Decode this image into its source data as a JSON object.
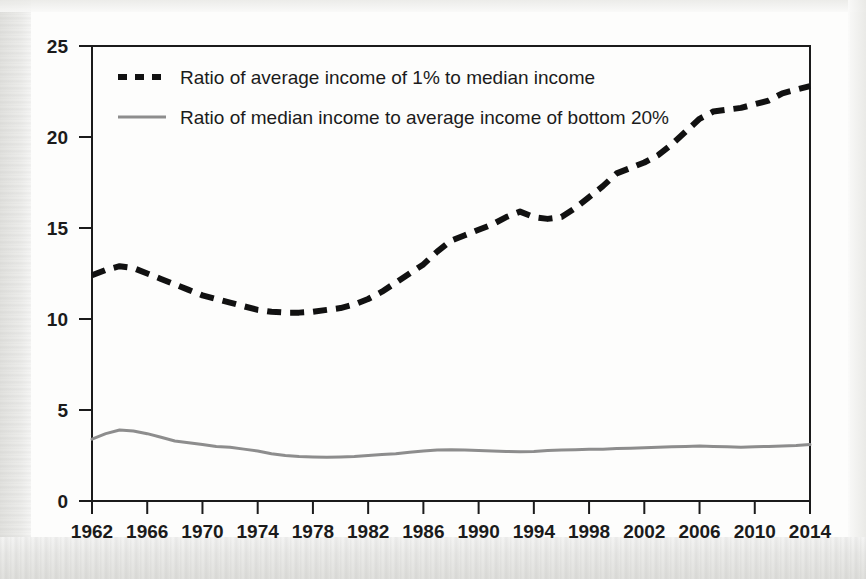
{
  "chart_data": {
    "type": "line",
    "title": "",
    "xlabel": "",
    "ylabel": "",
    "xlim": [
      1962,
      2014
    ],
    "ylim": [
      0,
      25
    ],
    "grid": false,
    "legend_position": "top-left",
    "xticks": [
      1962,
      1966,
      1970,
      1974,
      1978,
      1982,
      1986,
      1990,
      1994,
      1998,
      2002,
      2006,
      2010,
      2014
    ],
    "yticks": [
      0,
      5,
      10,
      15,
      20,
      25
    ],
    "x": [
      1962,
      1963,
      1964,
      1965,
      1966,
      1967,
      1968,
      1969,
      1970,
      1971,
      1972,
      1973,
      1974,
      1975,
      1976,
      1977,
      1978,
      1979,
      1980,
      1981,
      1982,
      1983,
      1984,
      1985,
      1986,
      1987,
      1988,
      1989,
      1990,
      1991,
      1992,
      1993,
      1994,
      1995,
      1996,
      1997,
      1998,
      1999,
      2000,
      2001,
      2002,
      2003,
      2004,
      2005,
      2006,
      2007,
      2008,
      2009,
      2010,
      2011,
      2012,
      2013,
      2014
    ],
    "series": [
      {
        "name": "Ratio of average income of 1% to median income",
        "style": "dashed",
        "color": "#111111",
        "values": [
          12.4,
          12.7,
          12.9,
          12.8,
          12.5,
          12.2,
          11.9,
          11.6,
          11.3,
          11.1,
          10.9,
          10.7,
          10.5,
          10.4,
          10.35,
          10.35,
          10.4,
          10.5,
          10.6,
          10.8,
          11.1,
          11.5,
          12.0,
          12.5,
          13.0,
          13.7,
          14.3,
          14.6,
          14.9,
          15.2,
          15.6,
          15.9,
          15.6,
          15.5,
          15.6,
          16.1,
          16.7,
          17.3,
          18.0,
          18.3,
          18.6,
          19.0,
          19.6,
          20.3,
          21.0,
          21.4,
          21.5,
          21.6,
          21.8,
          22.0,
          22.4,
          22.6,
          22.8
        ]
      },
      {
        "name": "Ratio of median income to average income of bottom 20%",
        "style": "solid",
        "color": "#8d8d8d",
        "values": [
          3.4,
          3.7,
          3.9,
          3.85,
          3.7,
          3.5,
          3.3,
          3.2,
          3.1,
          3.0,
          2.95,
          2.85,
          2.75,
          2.6,
          2.5,
          2.45,
          2.42,
          2.4,
          2.42,
          2.45,
          2.5,
          2.55,
          2.6,
          2.68,
          2.75,
          2.8,
          2.82,
          2.8,
          2.78,
          2.75,
          2.72,
          2.7,
          2.72,
          2.78,
          2.8,
          2.82,
          2.85,
          2.85,
          2.88,
          2.9,
          2.92,
          2.95,
          2.98,
          3.0,
          3.02,
          3.0,
          2.98,
          2.96,
          2.98,
          3.0,
          3.02,
          3.05,
          3.1
        ]
      }
    ]
  },
  "axis": {
    "y_tick_labels": [
      "25",
      "20",
      "15",
      "10",
      "5",
      "0"
    ],
    "x_tick_labels": [
      "1962",
      "1966",
      "1970",
      "1974",
      "1978",
      "1982",
      "1986",
      "1990",
      "1994",
      "1998",
      "2002",
      "2006",
      "2010",
      "2014"
    ]
  },
  "legend": {
    "items": [
      {
        "label": "Ratio of average income of 1% to median income",
        "marker": "dashed-line-marker"
      },
      {
        "label": "Ratio of median income to average income of bottom 20%",
        "marker": "solid-line-marker"
      }
    ]
  }
}
